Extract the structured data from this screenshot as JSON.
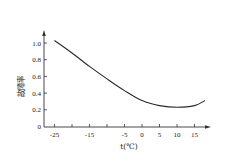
{
  "chart_data": {
    "type": "line",
    "title": "",
    "xlabel": "t(℃)",
    "ylabel": "故障率",
    "xlim": [
      -28,
      18
    ],
    "ylim": [
      0,
      1.1
    ],
    "grid": false,
    "legend": null,
    "x_ticks": [
      -25,
      -15,
      -5,
      0,
      5,
      10,
      15
    ],
    "x_tick_labels": [
      "-25",
      "-15",
      "-5",
      "0",
      "5",
      "10",
      "15"
    ],
    "x_minor_ticks": [
      -20,
      -10
    ],
    "y_ticks": [
      0,
      0.2,
      0.4,
      0.6,
      0.8,
      1.0
    ],
    "y_tick_labels": [
      "0",
      "0.2",
      "0.4",
      "0.6",
      "0.8",
      "1.0"
    ],
    "series": [
      {
        "name": "故障率",
        "x": [
          -25,
          -20,
          -15,
          -10,
          -5,
          0,
          5,
          10,
          15,
          18
        ],
        "values": [
          1.03,
          0.88,
          0.72,
          0.57,
          0.43,
          0.31,
          0.25,
          0.23,
          0.25,
          0.31
        ]
      }
    ],
    "colors": {
      "line": "#2a2a2a",
      "axis": "#333333",
      "text": "#222222"
    }
  }
}
